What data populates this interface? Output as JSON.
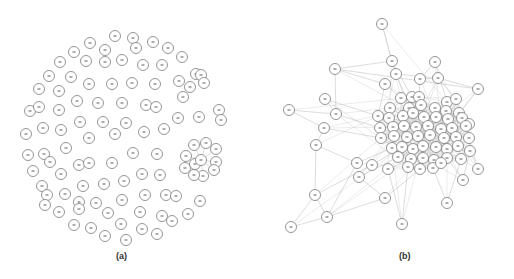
{
  "figure": {
    "panels": [
      {
        "id": "a",
        "caption": "(a)",
        "caption_pos": [
          122,
          257
        ],
        "description": "Mostly isolated nodes arranged in a roughly circular layout with one small star-shaped cluster",
        "node_radius": 5.5,
        "nodes": [
          [
            115,
            36
          ],
          [
            133,
            38
          ],
          [
            153,
            42
          ],
          [
            90,
            43
          ],
          [
            105,
            50
          ],
          [
            136,
            48
          ],
          [
            168,
            48
          ],
          [
            74,
            52
          ],
          [
            182,
            57
          ],
          [
            60,
            62
          ],
          [
            86,
            61
          ],
          [
            105,
            62
          ],
          [
            122,
            60
          ],
          [
            143,
            65
          ],
          [
            162,
            65
          ],
          [
            196,
            74
          ],
          [
            49,
            76
          ],
          [
            71,
            77
          ],
          [
            89,
            84
          ],
          [
            112,
            84
          ],
          [
            132,
            83
          ],
          [
            155,
            84
          ],
          [
            179,
            81
          ],
          [
            201,
            75
          ],
          [
            190,
            87
          ],
          [
            204,
            83
          ],
          [
            39,
            89
          ],
          [
            59,
            91
          ],
          [
            77,
            101
          ],
          [
            98,
            103
          ],
          [
            122,
            103
          ],
          [
            146,
            105
          ],
          [
            156,
            107
          ],
          [
            183,
            97
          ],
          [
            219,
            110
          ],
          [
            30,
            111
          ],
          [
            39,
            107
          ],
          [
            59,
            110
          ],
          [
            221,
            120
          ],
          [
            80,
            122
          ],
          [
            103,
            122
          ],
          [
            126,
            123
          ],
          [
            178,
            118
          ],
          [
            199,
            117
          ],
          [
            26,
            134
          ],
          [
            43,
            128
          ],
          [
            61,
            130
          ],
          [
            89,
            138
          ],
          [
            115,
            134
          ],
          [
            144,
            132
          ],
          [
            164,
            129
          ],
          [
            28,
            155
          ],
          [
            44,
            154
          ],
          [
            66,
            148
          ],
          [
            33,
            171
          ],
          [
            50,
            162
          ],
          [
            79,
            165
          ],
          [
            89,
            163
          ],
          [
            112,
            163
          ],
          [
            133,
            153
          ],
          [
            157,
            154
          ],
          [
            61,
            174
          ],
          [
            42,
            186
          ],
          [
            47,
            195
          ],
          [
            65,
            194
          ],
          [
            83,
            186
          ],
          [
            104,
            184
          ],
          [
            124,
            181
          ],
          [
            142,
            174
          ],
          [
            160,
            175
          ],
          [
            45,
            205
          ],
          [
            79,
            202
          ],
          [
            96,
            203
          ],
          [
            122,
            200
          ],
          [
            145,
            195
          ],
          [
            166,
            195
          ],
          [
            176,
            196
          ],
          [
            200,
            201
          ],
          [
            59,
            212
          ],
          [
            79,
            209
          ],
          [
            108,
            213
          ],
          [
            140,
            212
          ],
          [
            162,
            216
          ],
          [
            172,
            221
          ],
          [
            188,
            214
          ],
          [
            74,
            225
          ],
          [
            91,
            228
          ],
          [
            121,
            224
          ],
          [
            142,
            229
          ],
          [
            157,
            234
          ],
          [
            105,
            236
          ],
          [
            126,
            240
          ]
        ],
        "star_cluster": {
          "hub": [
            201,
            160
          ],
          "spokes": [
            [
              194,
              145
            ],
            [
              206,
              143
            ],
            [
              216,
              149
            ],
            [
              216,
              162
            ],
            [
              214,
              170
            ],
            [
              203,
              176
            ],
            [
              194,
              175
            ],
            [
              185,
              168
            ],
            [
              186,
              156
            ],
            [
              195,
              164
            ]
          ]
        }
      },
      {
        "id": "b",
        "caption": "(b)",
        "caption_pos": [
          405,
          257
        ],
        "description": "Densely connected network with a large central core and sparse peripheral nodes",
        "node_radius": 5.5,
        "peripheral_nodes": [
          [
            382,
            24
          ],
          [
            392,
            61
          ],
          [
            435,
            62
          ],
          [
            335,
            69
          ],
          [
            396,
            74
          ],
          [
            420,
            79
          ],
          [
            438,
            78
          ],
          [
            385,
            84
          ],
          [
            478,
            89
          ],
          [
            325,
            99
          ],
          [
            336,
            114
          ],
          [
            289,
            110
          ],
          [
            324,
            128
          ],
          [
            316,
            145
          ],
          [
            478,
            169
          ],
          [
            315,
            195
          ],
          [
            327,
            217
          ],
          [
            291,
            227
          ],
          [
            402,
            224
          ],
          [
            447,
            203
          ],
          [
            463,
            180
          ],
          [
            357,
            163
          ],
          [
            359,
            177
          ],
          [
            372,
            165
          ],
          [
            388,
            169
          ],
          [
            385,
            198
          ]
        ],
        "core_nodes": [
          [
            401,
            98
          ],
          [
            412,
            97
          ],
          [
            419,
            97
          ],
          [
            447,
            102
          ],
          [
            456,
            99
          ],
          [
            390,
            108
          ],
          [
            409,
            108
          ],
          [
            421,
            105
          ],
          [
            435,
            108
          ],
          [
            446,
            111
          ],
          [
            459,
            113
          ],
          [
            378,
            116
          ],
          [
            389,
            118
          ],
          [
            403,
            116
          ],
          [
            413,
            113
          ],
          [
            424,
            117
          ],
          [
            436,
            117
          ],
          [
            448,
            119
          ],
          [
            462,
            118
          ],
          [
            469,
            124
          ],
          [
            380,
            128
          ],
          [
            393,
            127
          ],
          [
            404,
            126
          ],
          [
            416,
            127
          ],
          [
            428,
            126
          ],
          [
            441,
            129
          ],
          [
            452,
            128
          ],
          [
            466,
            126
          ],
          [
            381,
            138
          ],
          [
            394,
            136
          ],
          [
            407,
            137
          ],
          [
            418,
            136
          ],
          [
            430,
            135
          ],
          [
            444,
            138
          ],
          [
            456,
            137
          ],
          [
            469,
            138
          ],
          [
            392,
            148
          ],
          [
            402,
            147
          ],
          [
            413,
            149
          ],
          [
            423,
            146
          ],
          [
            436,
            147
          ],
          [
            447,
            149
          ],
          [
            458,
            146
          ],
          [
            470,
            151
          ],
          [
            398,
            157
          ],
          [
            411,
            159
          ],
          [
            423,
            158
          ],
          [
            434,
            160
          ],
          [
            447,
            158
          ],
          [
            461,
            159
          ],
          [
            408,
            167
          ],
          [
            420,
            169
          ],
          [
            433,
            168
          ],
          [
            441,
            163
          ]
        ],
        "edges": [
          [
            [
              382,
              24
            ],
            [
              392,
              61
            ]
          ],
          [
            [
              392,
              61
            ],
            [
              396,
              74
            ]
          ],
          [
            [
              392,
              61
            ],
            [
              412,
              97
            ]
          ],
          [
            [
              335,
              69
            ],
            [
              392,
              61
            ]
          ],
          [
            [
              335,
              69
            ],
            [
              336,
              114
            ]
          ],
          [
            [
              335,
              69
            ],
            [
              385,
              84
            ]
          ],
          [
            [
              325,
              99
            ],
            [
              336,
              114
            ]
          ],
          [
            [
              325,
              99
            ],
            [
              378,
              116
            ]
          ],
          [
            [
              289,
              110
            ],
            [
              336,
              114
            ]
          ],
          [
            [
              289,
              110
            ],
            [
              324,
              128
            ]
          ],
          [
            [
              336,
              114
            ],
            [
              380,
              128
            ]
          ],
          [
            [
              324,
              128
            ],
            [
              381,
              138
            ]
          ],
          [
            [
              324,
              128
            ],
            [
              316,
              145
            ]
          ],
          [
            [
              316,
              145
            ],
            [
              315,
              195
            ]
          ],
          [
            [
              316,
              145
            ],
            [
              357,
              163
            ]
          ],
          [
            [
              315,
              195
            ],
            [
              327,
              217
            ]
          ],
          [
            [
              315,
              195
            ],
            [
              291,
              227
            ]
          ],
          [
            [
              327,
              217
            ],
            [
              291,
              227
            ]
          ],
          [
            [
              327,
              217
            ],
            [
              357,
              163
            ]
          ],
          [
            [
              327,
              217
            ],
            [
              385,
              198
            ]
          ],
          [
            [
              315,
              195
            ],
            [
              372,
              165
            ]
          ],
          [
            [
              402,
              224
            ],
            [
              408,
              167
            ]
          ],
          [
            [
              402,
              224
            ],
            [
              388,
              169
            ]
          ],
          [
            [
              447,
              203
            ],
            [
              433,
              168
            ]
          ],
          [
            [
              447,
              203
            ],
            [
              461,
              159
            ]
          ],
          [
            [
              463,
              180
            ],
            [
              470,
              151
            ]
          ],
          [
            [
              463,
              180
            ],
            [
              447,
              158
            ]
          ],
          [
            [
              478,
              169
            ],
            [
              470,
              151
            ]
          ],
          [
            [
              478,
              169
            ],
            [
              469,
              138
            ]
          ],
          [
            [
              478,
              89
            ],
            [
              459,
              113
            ]
          ],
          [
            [
              478,
              89
            ],
            [
              438,
              78
            ]
          ],
          [
            [
              435,
              62
            ],
            [
              420,
              79
            ]
          ],
          [
            [
              435,
              62
            ],
            [
              447,
              102
            ]
          ],
          [
            [
              396,
              74
            ],
            [
              438,
              78
            ]
          ],
          [
            [
              420,
              79
            ],
            [
              438,
              78
            ]
          ],
          [
            [
              385,
              84
            ],
            [
              401,
              98
            ]
          ],
          [
            [
              385,
              84
            ],
            [
              378,
              116
            ]
          ],
          [
            [
              420,
              79
            ],
            [
              419,
              97
            ]
          ],
          [
            [
              438,
              78
            ],
            [
              456,
              99
            ]
          ],
          [
            [
              396,
              74
            ],
            [
              409,
              108
            ]
          ],
          [
            [
              357,
              163
            ],
            [
              392,
              148
            ]
          ],
          [
            [
              359,
              177
            ],
            [
              398,
              157
            ]
          ],
          [
            [
              372,
              165
            ],
            [
              402,
              147
            ]
          ],
          [
            [
              388,
              169
            ],
            [
              411,
              159
            ]
          ],
          [
            [
              385,
              198
            ],
            [
              420,
              169
            ]
          ],
          [
            [
              359,
              177
            ],
            [
              385,
              198
            ]
          ],
          [
            [
              335,
              69
            ],
            [
              478,
              89
            ]
          ]
        ],
        "core_edge_density": "very high"
      }
    ]
  }
}
